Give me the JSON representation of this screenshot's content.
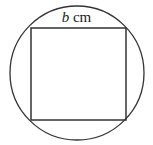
{
  "diagram": {
    "side_label": {
      "variable": "b",
      "unit": "cm"
    },
    "circle": {
      "cx": 77,
      "cy": 73,
      "r": 67
    },
    "square": {
      "x1": 31,
      "y1": 28,
      "x2": 126,
      "y2": 120
    },
    "stroke_color": "#333333"
  }
}
